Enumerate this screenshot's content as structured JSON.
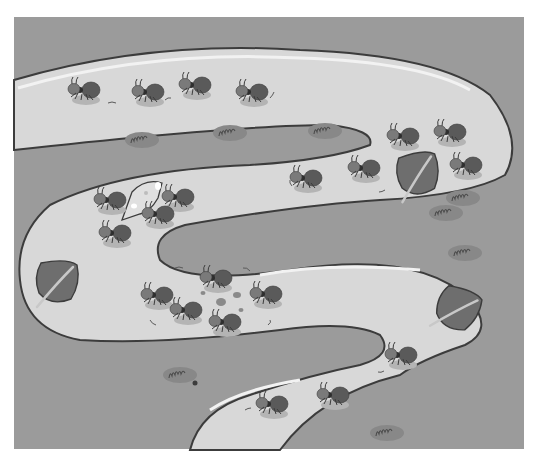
{
  "illustration": {
    "subject": "Ants marching along a winding sandy path",
    "style": "grayscale cartoon",
    "colors": {
      "page_background": "#ffffff",
      "ground": "#9b9b9b",
      "path": "#d8d8d8",
      "path_highlight": "#f2f2f2",
      "outline": "#3c3c3c",
      "ant_body": "#5a5a5a",
      "ant_head": "#7a7a7a",
      "ant_shadow": "#b4b4b4",
      "leaf": "#6e6e6e",
      "leaf_vein": "#c8c8c8",
      "cheese": "#e0e0e0",
      "grass_patch": "#888888"
    },
    "elements": {
      "ant_count": 24,
      "cheese_count": 1,
      "leaf_count": 3,
      "grass_tuft_count": 7,
      "crumb_count": 5
    }
  }
}
